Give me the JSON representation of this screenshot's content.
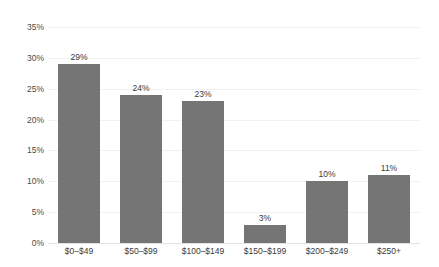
{
  "chart_data": {
    "type": "bar",
    "title": "",
    "xlabel": "",
    "ylabel": "",
    "categories": [
      "$0–$49",
      "$50–$99",
      "$100–$149",
      "$150–$199",
      "$200–$249",
      "$250+"
    ],
    "values": [
      29,
      24,
      23,
      3,
      10,
      11
    ],
    "value_labels": [
      "29%",
      "24%",
      "23%",
      "3%",
      "10%",
      "11%"
    ],
    "ylim": [
      0,
      35
    ],
    "ytick_values": [
      35,
      30,
      25,
      20,
      15,
      10,
      5,
      0
    ],
    "ytick_labels": [
      "35%",
      "30%",
      "25%",
      "20%",
      "15%",
      "10%",
      "5%",
      "0%"
    ],
    "grid": true,
    "legend": false,
    "legend_position": "none",
    "bar_color": "#757575",
    "gridline_color": "#f1f1f1",
    "axis_color": "#e2e2e2",
    "text_color": "#3a3a3a"
  }
}
